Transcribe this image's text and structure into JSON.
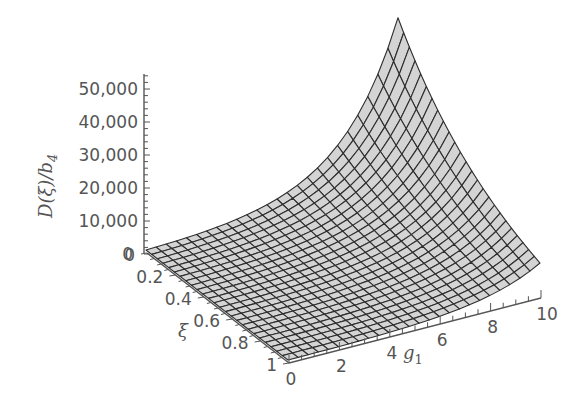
{
  "chart_data": {
    "type": "surface3d",
    "title": "",
    "zlabel": "D(ξ)/b4",
    "zlabel_parts": {
      "main": "D(ξ)/b",
      "sub": "4"
    },
    "xlabel": "g1",
    "xlabel_parts": {
      "main": "g",
      "sub": "1"
    },
    "ylabel": "ξ",
    "x_axis": {
      "name": "g1",
      "range": [
        0,
        10
      ],
      "ticks": [
        0,
        2,
        4,
        6,
        8,
        10
      ],
      "tick_labels": [
        "0",
        "2",
        "4",
        "6",
        "8",
        "10"
      ]
    },
    "y_axis": {
      "name": "ξ",
      "range": [
        0,
        1
      ],
      "ticks": [
        0,
        0.2,
        0.4,
        0.6,
        0.8,
        1
      ],
      "tick_labels": [
        "0",
        "0.2",
        "0.4",
        "0.6",
        "0.8",
        "1"
      ]
    },
    "z_axis": {
      "name": "D(ξ)/b4",
      "range": [
        0,
        50000
      ],
      "ticks": [
        0,
        10000,
        20000,
        30000,
        40000,
        50000
      ],
      "tick_labels": [
        "0",
        "10,000",
        "20,000",
        "30,000",
        "40,000",
        "50,000"
      ]
    },
    "corner_values": [
      {
        "xi": 0,
        "g1": 0,
        "D": 0
      },
      {
        "xi": 1,
        "g1": 0,
        "D": 0
      },
      {
        "xi": 0,
        "g1": 10,
        "D": 51000
      },
      {
        "xi": 1,
        "g1": 10,
        "D": 10000
      }
    ],
    "model": {
      "peak": 51000,
      "xi_decay": 1.63,
      "g_growth": 0.45
    },
    "grid": {
      "xi_lines": 25,
      "g1_lines": 25
    },
    "surface_color": "#d4d4d4",
    "mesh_color": "#2e2e2e",
    "axis_color": "#555555"
  }
}
